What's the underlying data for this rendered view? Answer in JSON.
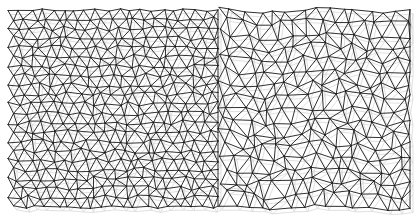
{
  "image": {
    "description": "Triangulated mesh (Delaunay-like wireframe), finer regular mesh on left half, coarser distorted mesh on right half",
    "background_color": "#ffffff",
    "edge_color": "#1a1a1a",
    "shadow_color": "#d8d8d8",
    "mesh_bounds": {
      "x0": 8,
      "y0": 10,
      "x1": 410,
      "y1": 207
    },
    "left_region": {
      "x0": 8,
      "x1": 218,
      "spacing": 11
    },
    "right_region": {
      "x0": 218,
      "x1": 410,
      "spacing": 14
    }
  }
}
